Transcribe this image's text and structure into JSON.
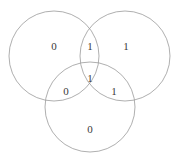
{
  "figure": {
    "name": "three-circle-venn-diagram",
    "background_color": "#ffffff",
    "stroke_color": "#9a9a9a",
    "text_color": "#3a3a3a",
    "width": 179,
    "height": 164
  },
  "circles": [
    {
      "name": "left-circle",
      "cx": 54,
      "cy": 56,
      "r": 45
    },
    {
      "name": "right-circle",
      "cx": 125,
      "cy": 56,
      "r": 45
    },
    {
      "name": "bottom-circle",
      "cx": 90,
      "cy": 107,
      "r": 45
    }
  ],
  "chart_data": {
    "type": "diagram",
    "title": "",
    "subtitle": "",
    "xlabel": "",
    "ylabel": "",
    "diagram_kind": "venn",
    "set_count": 3,
    "regions": [
      {
        "id": "left-only",
        "label": "0",
        "x": 54,
        "y": 46
      },
      {
        "id": "left-right",
        "label": "1",
        "x": 90,
        "y": 46
      },
      {
        "id": "right-only",
        "label": "1",
        "x": 126,
        "y": 46
      },
      {
        "id": "all-three",
        "label": "1",
        "x": 90,
        "y": 78
      },
      {
        "id": "left-bottom",
        "label": "0",
        "x": 66,
        "y": 91
      },
      {
        "id": "right-bottom",
        "label": "1",
        "x": 114,
        "y": 91
      },
      {
        "id": "bottom-only",
        "label": "0",
        "x": 90,
        "y": 129
      }
    ],
    "values": [
      0,
      1,
      1,
      1,
      0,
      1,
      0
    ],
    "categories": [
      "left-only",
      "left-right",
      "right-only",
      "all-three",
      "left-bottom",
      "right-bottom",
      "bottom-only"
    ],
    "legend": [],
    "annotations": []
  }
}
